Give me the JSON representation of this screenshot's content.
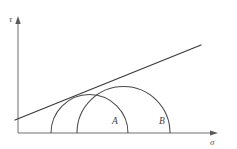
{
  "figure": {
    "background_color": "#ffffff",
    "width": 237,
    "height": 149
  },
  "axes": {
    "vertical": {
      "label": "τ",
      "name": "tau",
      "x": 18,
      "y_top": 17,
      "y_bottom": 133,
      "label_x": 9,
      "label_y": 20,
      "color": "#6e6e6e",
      "arrow": "up"
    },
    "horizontal": {
      "label": "σ",
      "name": "sigma",
      "y": 133,
      "x_left": 18,
      "x_right": 218,
      "label_x": 210,
      "label_y": 145,
      "color": "#6e6e6e",
      "arrow": "right"
    }
  },
  "chart_data": {
    "type": "scatter",
    "xlabel": "σ",
    "ylabel": "τ",
    "grid": false,
    "legend": null,
    "xlim": [
      18,
      218
    ],
    "ylim": [
      133,
      17
    ],
    "circles": [
      {
        "label": "A",
        "name": "mohr-circle-a",
        "center_x": 89.5,
        "center_y": 133,
        "radius": 38.5,
        "left_x": 51,
        "right_x": 128,
        "apex_y": 94.5,
        "stroke": "#4a4a4a",
        "label_x": 112,
        "label_y": 124
      },
      {
        "label": "B",
        "name": "mohr-circle-b",
        "center_x": 123.5,
        "center_y": 133,
        "radius": 46.5,
        "left_x": 77,
        "right_x": 170,
        "apex_y": 86.5,
        "stroke": "#4a4a4a",
        "label_x": 159,
        "label_y": 124
      }
    ],
    "tangent": {
      "name": "failure-envelope",
      "x1": 15,
      "y1": 120,
      "x2": 201,
      "y2": 45,
      "slope": -0.403,
      "stroke": "#3a3a3a"
    }
  }
}
